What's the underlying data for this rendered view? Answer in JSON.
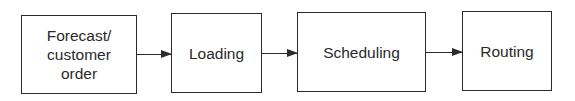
{
  "diagram": {
    "type": "flowchart",
    "direction": "left-to-right",
    "nodes": [
      {
        "id": "forecast",
        "label": "Forecast/\ncustomer\norder"
      },
      {
        "id": "loading",
        "label": "Loading"
      },
      {
        "id": "scheduling",
        "label": "Scheduling"
      },
      {
        "id": "routing",
        "label": "Routing"
      }
    ],
    "edges": [
      {
        "from": "forecast",
        "to": "loading"
      },
      {
        "from": "loading",
        "to": "scheduling"
      },
      {
        "from": "scheduling",
        "to": "routing"
      }
    ],
    "colors": {
      "line": "#2b2b2b",
      "text": "#2a2a2a",
      "background": "#ffffff"
    }
  }
}
